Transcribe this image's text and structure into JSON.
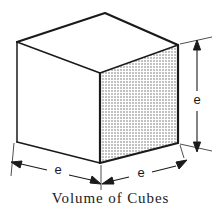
{
  "figure": {
    "caption": "Volume of Cubes",
    "shape_name": "cube",
    "projection": "isometric",
    "background_color": "#ffffff",
    "ink_color": "#1a1a1a",
    "faces": {
      "top": {
        "name": "top-face",
        "fill": "#ffffff"
      },
      "left": {
        "name": "left-face",
        "fill": "#ffffff"
      },
      "right": {
        "name": "right-face",
        "fill": "#d4d4d4",
        "shading": "halftone-dots"
      }
    },
    "dimensions": [
      {
        "id": "edge-right-vertical",
        "label": "e",
        "orientation": "vertical",
        "side": "right"
      },
      {
        "id": "edge-bottom-left",
        "label": "e",
        "orientation": "oblique",
        "side": "bottom-left"
      },
      {
        "id": "edge-bottom-right",
        "label": "e",
        "orientation": "oblique",
        "side": "bottom-right"
      }
    ],
    "ghost_bleed_text": "me of Itao"
  }
}
